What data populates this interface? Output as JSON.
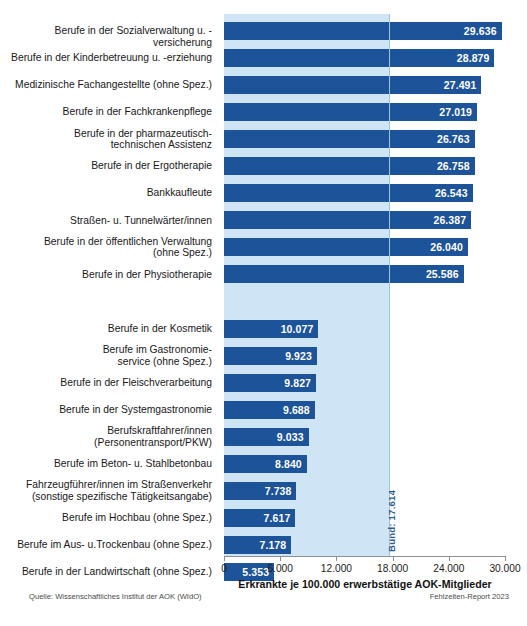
{
  "chart_data": {
    "type": "bar",
    "orientation": "horizontal",
    "title": "",
    "xlabel": "Erkrankte je 100.000 erwerbstätige AOK-Mitglieder",
    "ylabel": "",
    "xlim": [
      0,
      30000
    ],
    "xticks": [
      0,
      6000,
      12000,
      18000,
      24000,
      30000
    ],
    "xticklabels": [
      "0",
      "6.000",
      "12.000",
      "18.000",
      "24.000",
      "30.000"
    ],
    "grid": false,
    "legend": null,
    "bar_color": "#1d5399",
    "band_color": "#cfe5f5",
    "reference_line": {
      "label": "Bund: 17.614",
      "value": 17614
    },
    "groups": [
      {
        "name": "top",
        "categories": [
          "Berufe in der Sozialverwaltung u. -versicherung",
          "Berufe in der Kinderbetreuung u. -erziehung",
          "Medizinische Fachangestellte (ohne Spez.)",
          "Berufe in der Fachkrankenpflege",
          "Berufe in der pharmazeutisch-\ntechnischen Assistenz",
          "Berufe in der Ergotherapie",
          "Bankkaufleute",
          "Straßen- u. Tunnelwärter/innen",
          "Berufe in der öffentlichen Verwaltung\n(ohne Spez.)",
          "Berufe in der Physiotherapie"
        ],
        "values": [
          29636,
          28879,
          27491,
          27019,
          26763,
          26758,
          26543,
          26387,
          26040,
          25586
        ],
        "labels": [
          "29.636",
          "28.879",
          "27.491",
          "27.019",
          "26.763",
          "26.758",
          "26.543",
          "26.387",
          "26.040",
          "25.586"
        ]
      },
      {
        "name": "bottom",
        "categories": [
          "Berufe in der Kosmetik",
          "Berufe im Gastronomie-\nservice (ohne Spez.)",
          "Berufe in der Fleischverarbeitung",
          "Berufe in der Systemgastronomie",
          "Berufskraftfahrer/innen\n(Personentransport/PKW)",
          "Berufe im Beton- u. Stahlbetonbau",
          "Fahrzeugführer/innen im Straßenverkehr\n(sonstige spezifische Tätigkeitsangabe)",
          "Berufe im Hochbau (ohne Spez.)",
          "Berufe im Aus- u.Trockenbau (ohne Spez.)",
          "Berufe in der Landwirtschaft (ohne Spez.)"
        ],
        "values": [
          10077,
          9923,
          9827,
          9688,
          9033,
          8840,
          7738,
          7617,
          7178,
          5353
        ],
        "labels": [
          "10.077",
          "9.923",
          "9.827",
          "9.688",
          "9.033",
          "8.840",
          "7.738",
          "7.617",
          "7.178",
          "5.353"
        ]
      }
    ]
  },
  "footer": {
    "source": "Quelle: Wissenschaftliches Institut der AOK (WIdO)",
    "report": "Fehlzeiten-Report 2023"
  }
}
